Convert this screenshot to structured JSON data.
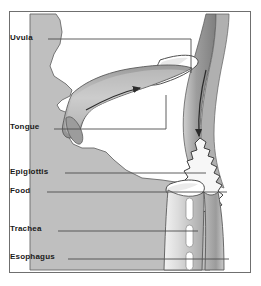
{
  "figure": {
    "type": "anatomical-diagram",
    "background_color": "#ffffff",
    "tissue_color": "#bfbfbf",
    "cavity_color": "#ffffff",
    "outline_color": "#555555",
    "frame_color": "#6f6f6f",
    "label_color": "#1a1a1a",
    "leader_color": "#4d4d4d"
  },
  "labels": [
    {
      "id": "uvula",
      "text": "Uvula",
      "leader_end_x": 190,
      "leader_end_y": 70
    },
    {
      "id": "tongue",
      "text": "Tongue",
      "leader_end_x": 165,
      "leader_end_y": 90
    },
    {
      "id": "epiglottis",
      "text": "Epiglottis",
      "leader_end_x": 205,
      "leader_end_y": 171
    },
    {
      "id": "food",
      "text": "Food",
      "leader_end_x": 226,
      "leader_end_y": 190
    },
    {
      "id": "trachea",
      "text": "Trachea",
      "leader_end_x": 197,
      "leader_end_y": 228
    },
    {
      "id": "esophagus",
      "text": "Esophagus",
      "leader_end_x": 228,
      "leader_end_y": 256
    }
  ],
  "structures": [
    {
      "id": "hard-palate-tongue",
      "name": "Tongue and hard palate"
    },
    {
      "id": "uvula-soft-palate",
      "name": "Uvula / soft palate"
    },
    {
      "id": "pharynx-wall",
      "name": "Pharyngeal wall"
    },
    {
      "id": "food-bolus",
      "name": "Food bolus"
    },
    {
      "id": "epiglottis-flap",
      "name": "Epiglottis"
    },
    {
      "id": "trachea-tube",
      "name": "Trachea with cartilage rings"
    },
    {
      "id": "esophagus-tube",
      "name": "Esophagus"
    }
  ],
  "arrows": [
    {
      "id": "tongue-arrow",
      "direction": "posterior",
      "description": "Tongue pushes bolus backward"
    },
    {
      "id": "pharynx-arrow",
      "direction": "inferior",
      "description": "Bolus travels down pharynx"
    }
  ]
}
